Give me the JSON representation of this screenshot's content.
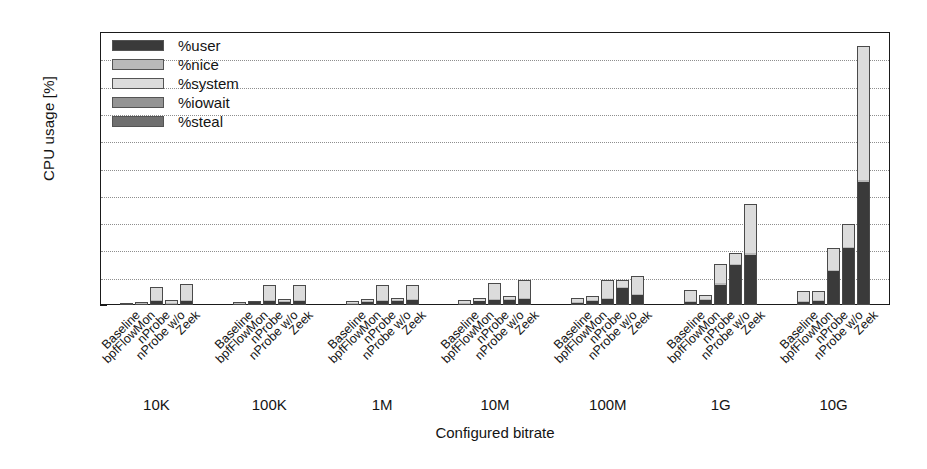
{
  "chart_data": {
    "type": "bar",
    "subtype": "grouped-stacked-bar",
    "title": "",
    "xlabel": "Configured bitrate",
    "ylabel": "CPU usage [%]",
    "ylim": [
      0,
      20
    ],
    "ytick_values": [
      0,
      2,
      4,
      6,
      8,
      10,
      12,
      14,
      16,
      18,
      20
    ],
    "ytick_labels": [
      "0",
      "2",
      "4",
      "6",
      "8",
      "10",
      "12",
      "14",
      "16",
      "18",
      "20"
    ],
    "grid": "horizontal-dotted",
    "legend_position": "top-left-inside",
    "categories": [
      "10K",
      "100K",
      "1M",
      "10M",
      "100M",
      "1G",
      "10G"
    ],
    "subcategories": [
      "Baseline",
      "bpfFlowMon",
      "nProbe",
      "nProbe w/o",
      "Zeek"
    ],
    "series": [
      {
        "name": "%user",
        "color": "#3a3a3a",
        "values": [
          [
            0.05,
            0.08,
            0.3,
            0.1,
            0.28
          ],
          [
            0.06,
            0.22,
            0.3,
            0.22,
            0.33
          ],
          [
            0.1,
            0.25,
            0.33,
            0.3,
            0.38
          ],
          [
            0.12,
            0.28,
            0.35,
            0.35,
            0.45
          ],
          [
            0.18,
            0.3,
            0.45,
            1.25,
            0.75
          ],
          [
            0.2,
            0.35,
            1.5,
            2.9,
            3.7
          ],
          [
            0.25,
            0.3,
            2.5,
            4.15,
            9.0
          ]
        ]
      },
      {
        "name": "%nice",
        "color": "#b9b9b9",
        "values": [
          [
            0.02,
            0.02,
            0.05,
            0.03,
            0.06
          ],
          [
            0.02,
            0.03,
            0.05,
            0.04,
            0.06
          ],
          [
            0.02,
            0.03,
            0.05,
            0.04,
            0.06
          ],
          [
            0.02,
            0.03,
            0.06,
            0.05,
            0.07
          ],
          [
            0.03,
            0.04,
            0.07,
            0.07,
            0.09
          ],
          [
            0.03,
            0.05,
            0.08,
            0.09,
            0.12
          ],
          [
            0.04,
            0.05,
            0.1,
            0.12,
            0.18
          ]
        ]
      },
      {
        "name": "%system",
        "color": "#dcdcdc",
        "values": [
          [
            0.08,
            0.14,
            0.95,
            0.21,
            1.21
          ],
          [
            0.14,
            0.08,
            1.1,
            0.17,
            1.11
          ],
          [
            0.18,
            0.17,
            1.12,
            0.21,
            1.06
          ],
          [
            0.21,
            0.19,
            1.19,
            0.25,
            1.28
          ],
          [
            0.29,
            0.31,
            1.28,
            0.48,
            1.26
          ],
          [
            0.87,
            0.3,
            1.42,
            0.81,
            3.58
          ],
          [
            0.71,
            0.65,
            1.6,
            1.63,
            9.82
          ]
        ]
      },
      {
        "name": "%iowait",
        "color": "#949494",
        "values": [
          [
            0.0,
            0.0,
            0.0,
            0.0,
            0.0
          ],
          [
            0.0,
            0.0,
            0.0,
            0.0,
            0.0
          ],
          [
            0.0,
            0.0,
            0.0,
            0.0,
            0.0
          ],
          [
            0.0,
            0.0,
            0.0,
            0.0,
            0.0
          ],
          [
            0.0,
            0.0,
            0.0,
            0.0,
            0.0
          ],
          [
            0.0,
            0.0,
            0.0,
            0.0,
            0.0
          ],
          [
            0.0,
            0.0,
            0.0,
            0.0,
            0.0
          ]
        ]
      },
      {
        "name": "%steal",
        "color": "#6f6f6f",
        "values": [
          [
            0.0,
            0.0,
            0.0,
            0.0,
            0.0
          ],
          [
            0.0,
            0.0,
            0.0,
            0.0,
            0.0
          ],
          [
            0.0,
            0.0,
            0.0,
            0.0,
            0.0
          ],
          [
            0.0,
            0.0,
            0.0,
            0.0,
            0.0
          ],
          [
            0.0,
            0.0,
            0.0,
            0.0,
            0.0
          ],
          [
            0.0,
            0.0,
            0.0,
            0.0,
            0.0
          ],
          [
            0.0,
            0.0,
            0.0,
            0.0,
            0.0
          ]
        ]
      }
    ],
    "totals": [
      [
        0.15,
        0.24,
        1.3,
        0.34,
        1.55
      ],
      [
        0.22,
        0.33,
        1.45,
        0.43,
        1.5
      ],
      [
        0.3,
        0.45,
        1.5,
        0.55,
        1.5
      ],
      [
        0.35,
        0.5,
        1.6,
        0.65,
        1.8
      ],
      [
        0.5,
        0.65,
        1.8,
        1.8,
        2.1
      ],
      [
        1.1,
        0.7,
        3.0,
        3.8,
        7.4
      ],
      [
        1.0,
        1.0,
        4.2,
        5.9,
        19.0
      ]
    ]
  },
  "legend": {
    "entries": [
      {
        "label": "%user",
        "color": "#3a3a3a"
      },
      {
        "label": "%nice",
        "color": "#b9b9b9"
      },
      {
        "label": "%system",
        "color": "#dcdcdc"
      },
      {
        "label": "%iowait",
        "color": "#949494"
      },
      {
        "label": "%steal",
        "color": "#6f6f6f"
      }
    ]
  }
}
